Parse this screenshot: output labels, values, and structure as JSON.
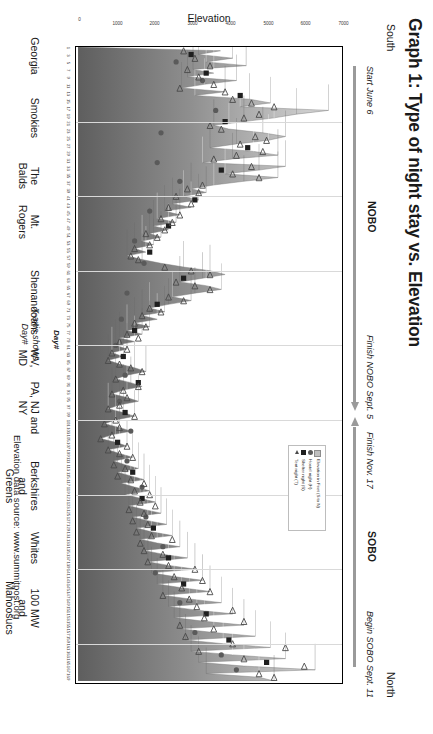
{
  "title": "Graph 1: Type of night stay vs. Elevation",
  "compass": {
    "south": "South",
    "north": "North"
  },
  "annotations": {
    "start_nobo": "Start June 6",
    "finish_nobo": "Finish NOBO Sept. 5",
    "nobo": "NOBO",
    "finish_sobo": "Finish Nov. 17",
    "sobo": "SOBO",
    "begin_sobo": "Begin SOBO Sept. 11"
  },
  "source_note": "Elevation data source: www.summitpost.org",
  "axis_note_line1": "X-axis shows",
  "axis_note_line2": "Day#",
  "legend": {
    "items": [
      {
        "label": "Elevation in Feet  (S to N)",
        "key": "area-swatch"
      },
      {
        "label": "Hostel night (H)",
        "key": "circle-marker"
      },
      {
        "label": "Shelter night (S)",
        "key": "square-marker"
      },
      {
        "label": "Tent night (T)",
        "key": "triangle-marker"
      }
    ]
  },
  "regions": [
    {
      "lines": [
        "Georgia"
      ]
    },
    {
      "lines": [
        "Smokies"
      ]
    },
    {
      "lines": [
        "The",
        "Balds"
      ]
    },
    {
      "lines": [
        "Mt.",
        "Rogers"
      ]
    },
    {
      "lines": [
        "Shenandoahs"
      ]
    },
    {
      "lines": [
        "WV,",
        "MD"
      ]
    },
    {
      "lines": [
        "PA, NJ and NY"
      ]
    },
    {
      "lines": [
        "Berkshires",
        "and",
        "Greens"
      ]
    },
    {
      "lines": [
        "Whites"
      ]
    },
    {
      "lines": [
        "100 MW",
        "and",
        "Mahoosucs"
      ]
    }
  ],
  "chart_data": {
    "type": "area",
    "title": "Graph 1: Type of night stay vs. Elevation",
    "xlabel": "Day#",
    "ylabel": "Elevation",
    "xlim": [
      0,
      170
    ],
    "ylim": [
      0,
      7000
    ],
    "grid": true,
    "legend_position": "inside-upper-right",
    "yticks": [
      0,
      1000,
      2000,
      3000,
      4000,
      5000,
      6000,
      7000
    ],
    "xticks": [
      1,
      3,
      5,
      7,
      9,
      11,
      13,
      15,
      17,
      19,
      21,
      23,
      25,
      27,
      29,
      31,
      33,
      35,
      37,
      39,
      41,
      43,
      45,
      47,
      49,
      51,
      53,
      55,
      57,
      59,
      61,
      63,
      65,
      67,
      69,
      71,
      73,
      75,
      77,
      79,
      81,
      83,
      85,
      87,
      89,
      91,
      93,
      95,
      97,
      99,
      101,
      103,
      105,
      107,
      109,
      111,
      113,
      115,
      117,
      119,
      121,
      123,
      125,
      127,
      129,
      131,
      133,
      135,
      137,
      139,
      141,
      143,
      145,
      147,
      149,
      151,
      153,
      155,
      157,
      159,
      161,
      163,
      165,
      167,
      169
    ],
    "series": [
      {
        "name": "Elevation in Feet  (S to N)",
        "type": "area",
        "color": "#9a9a9a",
        "values": [
          3780,
          3200,
          4100,
          3400,
          4460,
          3050,
          3600,
          2900,
          4200,
          3350,
          2750,
          3900,
          3100,
          4550,
          5100,
          4300,
          6640,
          5800,
          5200,
          4400,
          3600,
          4000,
          4900,
          5500,
          5050,
          4200,
          3500,
          4650,
          5300,
          4100,
          3300,
          5500,
          4800,
          3900,
          5300,
          4400,
          3600,
          3000,
          3400,
          2800,
          3200,
          2500,
          3000,
          2300,
          2700,
          2100,
          2600,
          2000,
          2400,
          1900,
          2200,
          1700,
          2000,
          1500,
          1800,
          1300,
          1700,
          2200,
          2800,
          3500,
          3900,
          3300,
          2700,
          3400,
          3800,
          3100,
          2500,
          3000,
          2400,
          1900,
          2300,
          1700,
          2100,
          1500,
          1900,
          1300,
          1700,
          1100,
          1500,
          1000,
          1300,
          900,
          1200,
          800,
          1100,
          1500,
          1800,
          1300,
          1000,
          1400,
          1700,
          1200,
          900,
          1300,
          1600,
          1100,
          800,
          1200,
          1500,
          1000,
          700,
          1100,
          1400,
          900,
          600,
          1000,
          1300,
          800,
          1100,
          1450,
          950,
          1250,
          1600,
          1050,
          1400,
          1750,
          1150,
          1500,
          1900,
          1250,
          1650,
          2050,
          1350,
          1750,
          2200,
          1450,
          1850,
          2350,
          1550,
          1950,
          2500,
          1650,
          2100,
          2700,
          1750,
          2250,
          2900,
          1850,
          2400,
          3100,
          1950,
          2550,
          3300,
          2100,
          2750,
          3500,
          2250,
          2950,
          3800,
          2400,
          3150,
          4100,
          2550,
          3350,
          4400,
          2700,
          3600,
          4700,
          2850,
          3850,
          5100,
          3000,
          4100,
          5500,
          3200,
          4400,
          6288,
          3400,
          4800,
          5200
        ],
        "note": "Appalachian Trail elevation profile, south to north, feet"
      },
      {
        "name": "Hostel night (H)",
        "type": "scatter",
        "marker": "circle",
        "color": "#5a5a5a",
        "points": [
          [
            4,
            2600
          ],
          [
            9,
            3300
          ],
          [
            17,
            3650
          ],
          [
            23,
            2200
          ],
          [
            31,
            2100
          ],
          [
            36,
            2700
          ],
          [
            44,
            1900
          ],
          [
            52,
            1500
          ],
          [
            58,
            1750
          ],
          [
            66,
            1300
          ],
          [
            73,
            1150
          ],
          [
            80,
            1000
          ],
          [
            88,
            1250
          ],
          [
            95,
            1100
          ],
          [
            103,
            1400
          ],
          [
            111,
            1300
          ],
          [
            118,
            1700
          ],
          [
            126,
            1800
          ],
          [
            134,
            2250
          ],
          [
            141,
            2050
          ],
          [
            149,
            2700
          ],
          [
            157,
            3100
          ],
          [
            163,
            3800
          ],
          [
            167,
            4200
          ]
        ]
      },
      {
        "name": "Shelter night (S)",
        "type": "scatter",
        "marker": "square",
        "color": "#1f1f1f",
        "points": [
          [
            2,
            3000
          ],
          [
            7,
            3400
          ],
          [
            13,
            4300
          ],
          [
            20,
            3900
          ],
          [
            27,
            4500
          ],
          [
            33,
            3800
          ],
          [
            41,
            3100
          ],
          [
            48,
            2400
          ],
          [
            55,
            1900
          ],
          [
            62,
            2800
          ],
          [
            69,
            2100
          ],
          [
            76,
            1500
          ],
          [
            83,
            1200
          ],
          [
            90,
            1600
          ],
          [
            98,
            1250
          ],
          [
            106,
            1050
          ],
          [
            114,
            1450
          ],
          [
            121,
            1700
          ],
          [
            129,
            2000
          ],
          [
            137,
            2400
          ],
          [
            144,
            2800
          ],
          [
            152,
            3400
          ],
          [
            159,
            4000
          ],
          [
            165,
            5000
          ]
        ]
      },
      {
        "name": "Tent night (T)",
        "type": "scatter",
        "marker": "triangle",
        "color": "#4a4a4a",
        "points": [
          [
            1,
            2800
          ],
          [
            3,
            3100
          ],
          [
            5,
            3500
          ],
          [
            6,
            2900
          ],
          [
            8,
            3200
          ],
          [
            10,
            3600
          ],
          [
            11,
            2700
          ],
          [
            12,
            3900
          ],
          [
            14,
            4100
          ],
          [
            15,
            4600
          ],
          [
            16,
            5200
          ],
          [
            18,
            4800
          ],
          [
            19,
            4400
          ],
          [
            21,
            3500
          ],
          [
            22,
            3800
          ],
          [
            24,
            4700
          ],
          [
            25,
            5000
          ],
          [
            26,
            4300
          ],
          [
            28,
            4900
          ],
          [
            29,
            4200
          ],
          [
            30,
            3600
          ],
          [
            32,
            4600
          ],
          [
            34,
            4100
          ],
          [
            35,
            4800
          ],
          [
            37,
            3300
          ],
          [
            38,
            2900
          ],
          [
            39,
            3200
          ],
          [
            40,
            2600
          ],
          [
            42,
            3000
          ],
          [
            43,
            2400
          ],
          [
            45,
            2700
          ],
          [
            46,
            2200
          ],
          [
            47,
            2500
          ],
          [
            49,
            2300
          ],
          [
            50,
            1800
          ],
          [
            51,
            2100
          ],
          [
            53,
            1900
          ],
          [
            54,
            1500
          ],
          [
            56,
            1400
          ],
          [
            57,
            1600
          ],
          [
            59,
            2300
          ],
          [
            60,
            3000
          ],
          [
            61,
            3500
          ],
          [
            63,
            2600
          ],
          [
            64,
            3100
          ],
          [
            65,
            3500
          ],
          [
            67,
            2400
          ],
          [
            68,
            2800
          ],
          [
            70,
            1900
          ],
          [
            71,
            2200
          ],
          [
            72,
            1700
          ],
          [
            74,
            1500
          ],
          [
            75,
            1800
          ],
          [
            77,
            1300
          ],
          [
            78,
            1600
          ],
          [
            79,
            1100
          ],
          [
            81,
            1300
          ],
          [
            82,
            900
          ],
          [
            84,
            800
          ],
          [
            85,
            1100
          ],
          [
            86,
            1400
          ],
          [
            87,
            1700
          ],
          [
            89,
            1000
          ],
          [
            91,
            1600
          ],
          [
            92,
            1200
          ],
          [
            93,
            900
          ],
          [
            94,
            1300
          ],
          [
            96,
            1100
          ],
          [
            97,
            800
          ],
          [
            99,
            1500
          ],
          [
            100,
            1000
          ],
          [
            101,
            700
          ],
          [
            102,
            1100
          ],
          [
            104,
            900
          ],
          [
            105,
            600
          ],
          [
            107,
            1300
          ],
          [
            108,
            800
          ],
          [
            109,
            1100
          ],
          [
            110,
            1450
          ],
          [
            112,
            950
          ],
          [
            113,
            1250
          ],
          [
            115,
            1050
          ],
          [
            116,
            1400
          ],
          [
            117,
            1750
          ],
          [
            119,
            1500
          ],
          [
            120,
            1900
          ],
          [
            122,
            1650
          ],
          [
            123,
            2050
          ],
          [
            124,
            1350
          ],
          [
            125,
            1750
          ],
          [
            127,
            1450
          ],
          [
            128,
            1850
          ],
          [
            130,
            1550
          ],
          [
            131,
            1950
          ],
          [
            132,
            2500
          ],
          [
            133,
            1650
          ],
          [
            135,
            1750
          ],
          [
            136,
            2250
          ],
          [
            138,
            1850
          ],
          [
            139,
            2400
          ],
          [
            140,
            3100
          ],
          [
            142,
            2550
          ],
          [
            143,
            3300
          ],
          [
            145,
            2750
          ],
          [
            146,
            3500
          ],
          [
            147,
            2250
          ],
          [
            148,
            2950
          ],
          [
            150,
            3150
          ],
          [
            151,
            4100
          ],
          [
            153,
            3350
          ],
          [
            154,
            4400
          ],
          [
            155,
            2700
          ],
          [
            156,
            3600
          ],
          [
            158,
            2850
          ],
          [
            160,
            4100
          ],
          [
            161,
            5500
          ],
          [
            162,
            3200
          ],
          [
            164,
            4400
          ],
          [
            166,
            6000
          ],
          [
            168,
            4800
          ],
          [
            169,
            5200
          ]
        ]
      }
    ]
  }
}
